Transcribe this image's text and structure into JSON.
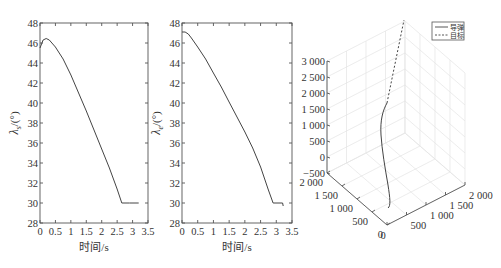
{
  "chart_data": [
    {
      "type": "line",
      "title": "",
      "xlabel": "时间/s",
      "ylabel": "λs/(°)",
      "ylabel_main": "λ",
      "ylabel_sub": "s",
      "ylabel_unit": "/(°)",
      "xlim": [
        0,
        3.5
      ],
      "ylim": [
        28,
        48
      ],
      "xticks": [
        "0",
        "0.5",
        "1",
        "1.5",
        "2",
        "2.5",
        "3",
        "3.5"
      ],
      "yticks": [
        "28",
        "30",
        "32",
        "34",
        "36",
        "38",
        "40",
        "42",
        "44",
        "46",
        "48"
      ],
      "grid": false,
      "series": [
        {
          "name": "λs",
          "x": [
            0,
            0.1,
            0.2,
            0.3,
            0.5,
            0.75,
            1.0,
            1.25,
            1.5,
            1.75,
            2.0,
            2.25,
            2.5,
            2.65,
            2.9,
            3.2
          ],
          "y": [
            45.5,
            46.3,
            46.45,
            46.3,
            45.6,
            44.4,
            42.8,
            41.0,
            39.2,
            37.3,
            35.4,
            33.5,
            31.4,
            30.0,
            30.0,
            30.0
          ]
        }
      ]
    },
    {
      "type": "line",
      "title": "",
      "xlabel": "时间/s",
      "ylabel": "λe/(°)",
      "ylabel_main": "λ",
      "ylabel_sub": "e",
      "ylabel_unit": "/(°)",
      "xlim": [
        0,
        3.5
      ],
      "ylim": [
        28,
        48
      ],
      "xticks": [
        "0",
        "0.5",
        "1",
        "1.5",
        "2",
        "2.5",
        "3",
        "3.5"
      ],
      "yticks": [
        "28",
        "30",
        "32",
        "34",
        "36",
        "38",
        "40",
        "42",
        "44",
        "46",
        "48"
      ],
      "grid": false,
      "series": [
        {
          "name": "λe",
          "x": [
            0,
            0.1,
            0.2,
            0.3,
            0.5,
            0.75,
            1.0,
            1.25,
            1.5,
            1.75,
            2.0,
            2.25,
            2.5,
            2.75,
            2.9,
            3.2,
            3.22
          ],
          "y": [
            47.1,
            47.1,
            46.9,
            46.5,
            45.6,
            44.4,
            43.0,
            41.6,
            40.1,
            38.6,
            37.1,
            35.5,
            33.6,
            31.3,
            30.0,
            30.0,
            29.7
          ]
        }
      ]
    },
    {
      "type": "line3d",
      "title": "",
      "xlabel": "",
      "ylabel": "",
      "zlabel": "",
      "xlim": [
        0,
        2000
      ],
      "ylim": [
        0,
        2000
      ],
      "zlim": [
        -500,
        3000
      ],
      "xticks": [
        "0",
        "500",
        "1 000",
        "1 500",
        "2 000"
      ],
      "yticks": [
        "0",
        "500",
        "1 000",
        "1 500",
        "2 000"
      ],
      "zticks": [
        "-500",
        "0",
        "500",
        "1 000",
        "1 500",
        "2 000",
        "2 500",
        "3 000"
      ],
      "grid": true,
      "legend": {
        "position": "upper right",
        "entries": [
          {
            "label": "导弹",
            "style": "solid"
          },
          {
            "label": "目标",
            "style": "dashed"
          }
        ]
      },
      "series": [
        {
          "name": "导弹",
          "style": "solid",
          "description": "missile trajectory rising from near origin to ~1600 altitude"
        },
        {
          "name": "目标",
          "style": "dashed",
          "description": "target trajectory continuing upward above 3000"
        }
      ]
    }
  ]
}
